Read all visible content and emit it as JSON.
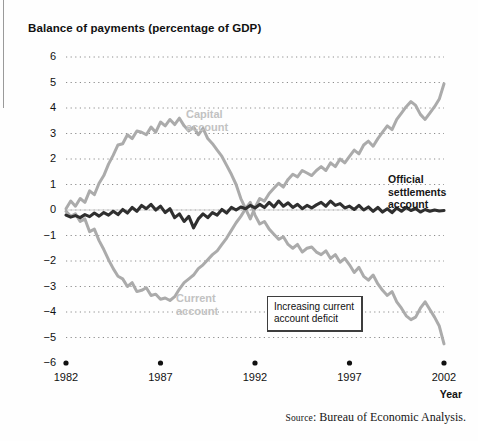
{
  "figure": {
    "title": "Balance of payments (percentage of GDP)",
    "source_prefix": "Source",
    "source_rest": ": Bureau of Economic Analysis.",
    "annotation": "Increasing current\naccount deficit",
    "year_axis_label": "Year",
    "colors": {
      "gray_series": "#ababab",
      "dark_series": "#2f2f2f",
      "gridline": "#8c8c8c",
      "series_label": "#c2c2c2",
      "text": "#111111",
      "background": "#ffffff"
    }
  },
  "labels": {
    "capital_account_line1": "Capital",
    "capital_account_line2": "account",
    "current_account_line1": "Current",
    "current_account_line2": "account",
    "official_line1": "Official",
    "official_line2": "settlements",
    "official_line3": "account"
  },
  "chart_data": {
    "type": "line",
    "title": "Balance of payments (percentage of GDP)",
    "xlabel": "Year",
    "ylabel": "percentage of GDP",
    "xlim": [
      1982,
      2002
    ],
    "ylim": [
      -6,
      6
    ],
    "xticks": [
      1982,
      1987,
      1992,
      1997,
      2002
    ],
    "yticks": [
      6,
      5,
      4,
      3,
      2,
      1,
      0,
      -1,
      -2,
      -3,
      -4,
      -5,
      -6
    ],
    "grid": "dotted-horizontal",
    "legend": "inline-annotations",
    "annotations": [
      {
        "text": "Capital account",
        "x": 1987.6,
        "y": 3.9
      },
      {
        "text": "Current account",
        "x": 1987.4,
        "y": -3.1
      },
      {
        "text": "Official settlements account",
        "x": 1998.6,
        "y": 1.1
      },
      {
        "text": "Increasing current account deficit",
        "x": 1992.8,
        "y": -3.5,
        "boxed": true
      }
    ],
    "x": [
      1982.0,
      1982.25,
      1982.5,
      1982.75,
      1983.0,
      1983.25,
      1983.5,
      1983.75,
      1984.0,
      1984.25,
      1984.5,
      1984.75,
      1985.0,
      1985.25,
      1985.5,
      1985.75,
      1986.0,
      1986.25,
      1986.5,
      1986.75,
      1987.0,
      1987.25,
      1987.5,
      1987.75,
      1988.0,
      1988.25,
      1988.5,
      1988.75,
      1989.0,
      1989.25,
      1989.5,
      1989.75,
      1990.0,
      1990.25,
      1990.5,
      1990.75,
      1991.0,
      1991.25,
      1991.5,
      1991.75,
      1992.0,
      1992.25,
      1992.5,
      1992.75,
      1993.0,
      1993.25,
      1993.5,
      1993.75,
      1994.0,
      1994.25,
      1994.5,
      1994.75,
      1995.0,
      1995.25,
      1995.5,
      1995.75,
      1996.0,
      1996.25,
      1996.5,
      1996.75,
      1997.0,
      1997.25,
      1997.5,
      1997.75,
      1998.0,
      1998.25,
      1998.5,
      1998.75,
      1999.0,
      1999.25,
      1999.5,
      1999.75,
      2000.0,
      2000.25,
      2000.5,
      2000.75,
      2001.0,
      2001.25,
      2001.5,
      2001.75,
      2002.0
    ],
    "series": [
      {
        "name": "Capital account",
        "color": "#ababab",
        "values": [
          0.05,
          0.35,
          0.15,
          0.45,
          0.3,
          0.75,
          0.6,
          1.05,
          1.35,
          1.8,
          2.15,
          2.55,
          2.6,
          2.95,
          2.8,
          3.1,
          3.05,
          2.95,
          3.25,
          3.05,
          3.45,
          3.3,
          3.55,
          3.35,
          3.6,
          3.3,
          3.1,
          3.25,
          2.95,
          3.2,
          2.8,
          2.6,
          2.35,
          2.1,
          1.75,
          1.4,
          1.0,
          0.45,
          0.05,
          -0.35,
          0.1,
          0.45,
          0.35,
          0.65,
          0.85,
          1.05,
          0.9,
          1.2,
          1.4,
          1.3,
          1.55,
          1.45,
          1.35,
          1.55,
          1.7,
          1.55,
          1.85,
          1.7,
          2.0,
          1.85,
          2.1,
          2.35,
          2.2,
          2.55,
          2.7,
          2.5,
          2.8,
          3.05,
          3.3,
          3.15,
          3.55,
          3.8,
          4.05,
          4.25,
          4.1,
          3.75,
          3.55,
          3.8,
          4.05,
          4.35,
          4.95
        ]
      },
      {
        "name": "Current account",
        "color": "#ababab",
        "values": [
          -0.05,
          -0.25,
          -0.15,
          -0.45,
          -0.35,
          -0.85,
          -0.75,
          -1.2,
          -1.55,
          -1.95,
          -2.3,
          -2.6,
          -2.7,
          -3.0,
          -2.85,
          -3.2,
          -3.15,
          -3.05,
          -3.35,
          -3.3,
          -3.5,
          -3.45,
          -3.55,
          -3.4,
          -3.1,
          -2.85,
          -2.7,
          -2.55,
          -2.3,
          -2.15,
          -1.95,
          -1.75,
          -1.6,
          -1.35,
          -1.1,
          -0.8,
          -0.5,
          -0.25,
          0.05,
          0.3,
          -0.2,
          -0.55,
          -0.45,
          -0.75,
          -0.95,
          -1.15,
          -1.05,
          -1.35,
          -1.5,
          -1.35,
          -1.65,
          -1.5,
          -1.45,
          -1.65,
          -1.75,
          -1.6,
          -1.9,
          -1.75,
          -2.05,
          -1.9,
          -2.15,
          -2.45,
          -2.25,
          -2.6,
          -2.75,
          -2.55,
          -2.9,
          -3.15,
          -3.35,
          -3.2,
          -3.6,
          -3.85,
          -4.15,
          -4.3,
          -4.2,
          -3.85,
          -3.6,
          -3.9,
          -4.2,
          -4.55,
          -5.25
        ]
      },
      {
        "name": "Official settlements account",
        "color": "#2f2f2f",
        "values": [
          -0.2,
          -0.28,
          -0.22,
          -0.3,
          -0.18,
          -0.26,
          -0.12,
          -0.24,
          -0.1,
          -0.2,
          -0.05,
          -0.18,
          0.02,
          -0.12,
          0.1,
          -0.05,
          0.18,
          0.05,
          0.22,
          0.0,
          0.15,
          -0.1,
          0.05,
          -0.3,
          -0.15,
          -0.45,
          -0.25,
          -0.7,
          -0.35,
          -0.15,
          -0.3,
          -0.1,
          -0.2,
          0.02,
          -0.12,
          0.1,
          0.0,
          0.12,
          0.05,
          0.18,
          0.08,
          0.22,
          0.1,
          0.3,
          0.12,
          0.35,
          0.15,
          0.28,
          0.1,
          0.22,
          0.05,
          0.18,
          0.08,
          0.2,
          0.3,
          0.15,
          0.35,
          0.18,
          0.25,
          0.08,
          0.15,
          0.02,
          0.18,
          0.0,
          0.12,
          -0.05,
          0.1,
          -0.08,
          0.05,
          -0.1,
          0.08,
          -0.05,
          0.1,
          -0.02,
          0.06,
          -0.08,
          0.02,
          -0.05,
          0.0,
          -0.04,
          -0.02
        ]
      }
    ]
  }
}
